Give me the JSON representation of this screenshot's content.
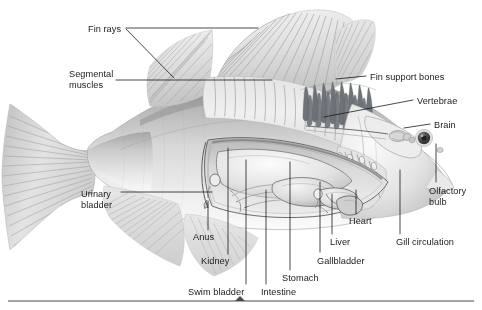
{
  "figure": {
    "style": "grayscale pencil / airbrush scientific illustration, lateral cutaway view, head facing right",
    "background_color": "#ffffff",
    "ink_color": "#1b1b1b",
    "body_light": "#ededed",
    "body_mid": "#cfcfcf",
    "body_shadow": "#a6a6a6",
    "bone_color": "#6e7378",
    "organ_outline": "#5d5d5d"
  },
  "labels": [
    {
      "id": "fin-rays",
      "text": "Fin rays",
      "lines": [
        "Fin rays"
      ],
      "align": "left",
      "x": 88,
      "y": 24
    },
    {
      "id": "segmental-muscles",
      "text": "Segmental muscles",
      "lines": [
        "Segmental",
        "muscles"
      ],
      "align": "left",
      "x": 69,
      "y": 69
    },
    {
      "id": "fin-support-bones",
      "text": "Fin support bones",
      "lines": [
        "Fin support bones"
      ],
      "align": "left",
      "x": 370,
      "y": 72
    },
    {
      "id": "vertebrae",
      "text": "Vertebrae",
      "lines": [
        "Vertebrae"
      ],
      "align": "left",
      "x": 417,
      "y": 96
    },
    {
      "id": "brain",
      "text": "Brain",
      "lines": [
        "Brain"
      ],
      "align": "left",
      "x": 434,
      "y": 120
    },
    {
      "id": "olfactory-bulb",
      "text": "Olfactory bulb",
      "lines": [
        "Olfactory",
        "bulb"
      ],
      "align": "left",
      "x": 429,
      "y": 186
    },
    {
      "id": "urinary-bladder",
      "text": "Urinary bladder",
      "lines": [
        "Urinary",
        "bladder"
      ],
      "align": "left",
      "x": 81,
      "y": 189
    },
    {
      "id": "heart",
      "text": "Heart",
      "lines": [
        "Heart"
      ],
      "align": "left",
      "x": 349,
      "y": 216
    },
    {
      "id": "anus",
      "text": "Anus",
      "lines": [
        "Anus"
      ],
      "align": "left",
      "x": 193,
      "y": 232
    },
    {
      "id": "liver",
      "text": "Liver",
      "lines": [
        "Liver"
      ],
      "align": "left",
      "x": 330,
      "y": 237
    },
    {
      "id": "gill-circulation",
      "text": "Gill circulation",
      "lines": [
        "Gill circulation"
      ],
      "align": "left",
      "x": 396,
      "y": 237
    },
    {
      "id": "kidney",
      "text": "Kidney",
      "lines": [
        "Kidney"
      ],
      "align": "left",
      "x": 201,
      "y": 256
    },
    {
      "id": "gallbladder",
      "text": "Gallbladder",
      "lines": [
        "Gallbladder"
      ],
      "align": "left",
      "x": 317,
      "y": 256
    },
    {
      "id": "stomach",
      "text": "Stomach",
      "lines": [
        "Stomach"
      ],
      "align": "left",
      "x": 282,
      "y": 273
    },
    {
      "id": "swim-bladder",
      "text": "Swim bladder",
      "lines": [
        "Swim bladder"
      ],
      "align": "left",
      "x": 188,
      "y": 287
    },
    {
      "id": "intestine",
      "text": "Intestine",
      "lines": [
        "Intestine"
      ],
      "align": "left",
      "x": 261,
      "y": 287
    }
  ],
  "footer_rule": {
    "y": 301,
    "x1": 8,
    "x2": 474,
    "marker_x": 240,
    "marker_shape": "caret-up"
  }
}
